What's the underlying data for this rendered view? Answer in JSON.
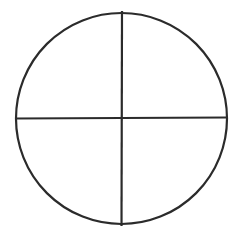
{
  "diagram": {
    "type": "circle-quadrants",
    "circle": {
      "cx": 121.5,
      "cy": 118.5,
      "r": 105.5
    },
    "vertical_line": {
      "x1": 122,
      "y1": 11,
      "x2": 121.5,
      "y2": 226
    },
    "horizontal_line": {
      "x1": 16,
      "y1": 118.5,
      "x2": 227,
      "y2": 117.5
    },
    "stroke_color": "#2b2b2b",
    "stroke_width": 2.2,
    "background": "#ffffff",
    "quadrant_count": 4
  }
}
